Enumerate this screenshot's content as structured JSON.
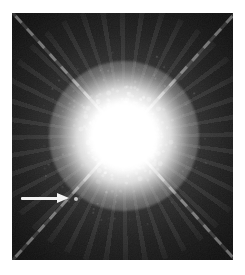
{
  "colors": {
    "page_background": "#ffffff",
    "photo_background": "#070707",
    "star": "#ffffff",
    "spike": "#e8e8e8",
    "arrow": "#f2f2f2",
    "companion_dot": "#c4c4c4"
  },
  "figure": {
    "kind": "astronomical photograph",
    "star": "bright overexposed star with four diffraction spikes in an X pattern",
    "annotation": "white arrow pointing right at a faint companion star dot",
    "frame": "black photo centered on a white margin"
  }
}
